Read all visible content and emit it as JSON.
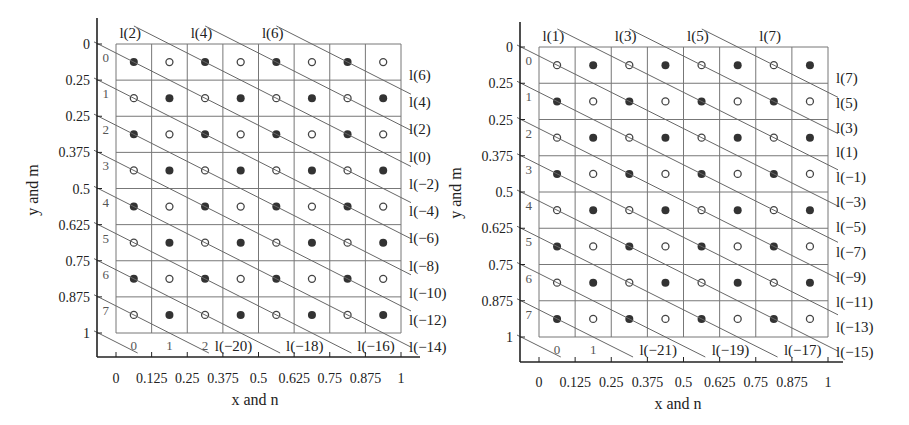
{
  "chart_data": [
    {
      "type": "diagram",
      "title": "",
      "xlabel": "x and n",
      "ylabel": "y and m",
      "x_ticks": [
        "0",
        "0.125",
        "0.25",
        "0.375",
        "0.5",
        "0.625",
        "0.75",
        "0.875",
        "1"
      ],
      "y_ticks": [
        "0",
        "0.25",
        "0.25",
        "0.375",
        "0.5",
        "0.625",
        "0.75",
        "0.875",
        "1"
      ],
      "row_labels": [
        "0",
        "1",
        "2",
        "3",
        "4",
        "5",
        "6",
        "7"
      ],
      "col_labels": [
        "0",
        "1",
        "2"
      ],
      "grid_size": [
        8,
        8
      ],
      "filled_rule": "(n+m) even",
      "top_line_labels": [
        "l(2)",
        "l(4)",
        "l(6)"
      ],
      "right_line_labels": [
        "l(6)",
        "l(4)",
        "l(2)",
        "l(0)",
        "l(−2)",
        "l(−4)",
        "l(−6)",
        "l(−8)",
        "l(−10)",
        "l(−12)",
        "l(−14)"
      ],
      "bottom_line_labels": [
        "l(−20)",
        "l(−18)",
        "l(−16)"
      ]
    },
    {
      "type": "diagram",
      "title": "",
      "xlabel": "x and n",
      "ylabel": "y and m",
      "x_ticks": [
        "0",
        "0.125",
        "0.25",
        "0.375",
        "0.5",
        "0.625",
        "0.75",
        "0.875",
        "1"
      ],
      "y_ticks": [
        "0",
        "0.25",
        "0.25",
        "0.375",
        "0.5",
        "0.625",
        "0.75",
        "0.875",
        "1"
      ],
      "row_labels": [
        "0",
        "1",
        "2",
        "3",
        "4",
        "5",
        "6",
        "7"
      ],
      "col_labels": [
        "0",
        "1"
      ],
      "grid_size": [
        8,
        8
      ],
      "filled_rule": "(n+m) odd",
      "top_line_labels": [
        "l(1)",
        "l(3)",
        "l(5)",
        "l(7)"
      ],
      "right_line_labels": [
        "l(7)",
        "l(5)",
        "l(3)",
        "l(1)",
        "l(−1)",
        "l(−3)",
        "l(−5)",
        "l(−7)",
        "l(−9)",
        "l(−11)",
        "l(−13)",
        "l(−15)"
      ],
      "bottom_line_labels": [
        "l(−21)",
        "l(−19)",
        "l(−17)"
      ]
    }
  ],
  "colors": {
    "axis": "#222222",
    "grid": "#777777",
    "line": "#666666",
    "dot_filled": "#333333",
    "dot_hollow_stroke": "#444444"
  }
}
